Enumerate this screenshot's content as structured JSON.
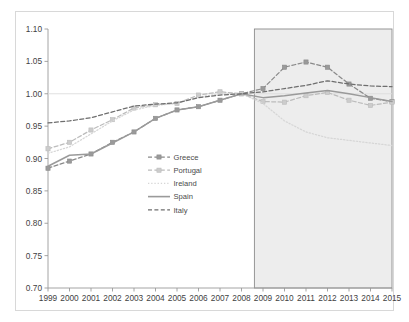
{
  "chart_data": {
    "type": "line",
    "title": "",
    "subtitle": "",
    "xlabel": "",
    "ylabel": "",
    "x": [
      1999,
      2000,
      2001,
      2002,
      2003,
      2004,
      2005,
      2006,
      2007,
      2008,
      2009,
      2010,
      2011,
      2012,
      2013,
      2014,
      2015
    ],
    "categories": [
      "1999",
      "2000",
      "2001",
      "2002",
      "2003",
      "2004",
      "2005",
      "2006",
      "2007",
      "2008",
      "2009",
      "2010",
      "2011",
      "2012",
      "2013",
      "2014",
      "2015"
    ],
    "xlim": [
      1999,
      2015
    ],
    "ylim": [
      0.7,
      1.1
    ],
    "yticks": [
      0.7,
      0.75,
      0.8,
      0.85,
      0.9,
      0.95,
      1.0,
      1.05,
      1.1
    ],
    "ytick_labels": [
      "0.70",
      "0.75",
      "0.80",
      "0.85",
      "0.90",
      "0.95",
      "1.00",
      "1.05",
      "1.10"
    ],
    "grid": false,
    "reference_line": 1.0,
    "legend_position": "center-left",
    "shaded_region": {
      "label": "",
      "x_start": 2008.6,
      "x_end": 2015,
      "fill": "#ededed",
      "stroke": "#8c8c8c"
    },
    "series": [
      {
        "name": "Greece",
        "color": "#8a8a8a",
        "style": "dashed",
        "marker": "square",
        "marker_fill": "#9a9a9a",
        "values": [
          0.885,
          0.896,
          0.907,
          0.925,
          0.941,
          0.962,
          0.975,
          0.98,
          0.99,
          1.0,
          1.008,
          1.041,
          1.049,
          1.041,
          1.015,
          0.993,
          0.988
        ]
      },
      {
        "name": "Portugal",
        "color": "#bcbcbc",
        "style": "dashed",
        "marker": "square",
        "marker_fill": "#cccccc",
        "values": [
          0.915,
          0.925,
          0.944,
          0.96,
          0.978,
          0.983,
          0.985,
          0.998,
          1.003,
          1.0,
          0.988,
          0.987,
          0.997,
          1.002,
          0.99,
          0.982,
          0.987
        ]
      },
      {
        "name": "Ireland",
        "color": "#d6d6d6",
        "style": "dotted",
        "marker": "none",
        "marker_fill": "#d6d6d6",
        "values": [
          0.908,
          0.918,
          0.938,
          0.958,
          0.975,
          0.982,
          0.985,
          0.995,
          1.0,
          1.0,
          0.985,
          0.958,
          0.941,
          0.932,
          0.928,
          0.924,
          0.92
        ]
      },
      {
        "name": "Spain",
        "color": "#9a9a9a",
        "style": "solid",
        "marker": "none",
        "marker_fill": "#9a9a9a",
        "values": [
          0.888,
          0.905,
          0.907,
          0.924,
          0.941,
          0.962,
          0.975,
          0.98,
          0.99,
          1.0,
          0.994,
          0.997,
          1.001,
          1.005,
          1.0,
          0.994,
          0.988
        ]
      },
      {
        "name": "Italy",
        "color": "#6e6e6e",
        "style": "dashed",
        "marker": "none",
        "marker_fill": "#6e6e6e",
        "values": [
          0.955,
          0.958,
          0.963,
          0.972,
          0.981,
          0.984,
          0.986,
          0.994,
          0.998,
          1.0,
          1.003,
          1.008,
          1.013,
          1.02,
          1.015,
          1.012,
          1.011
        ]
      }
    ]
  },
  "legend": {
    "items": [
      {
        "label": "Greece"
      },
      {
        "label": "Portugal"
      },
      {
        "label": "Ireland"
      },
      {
        "label": "Spain"
      },
      {
        "label": "Italy"
      }
    ]
  }
}
